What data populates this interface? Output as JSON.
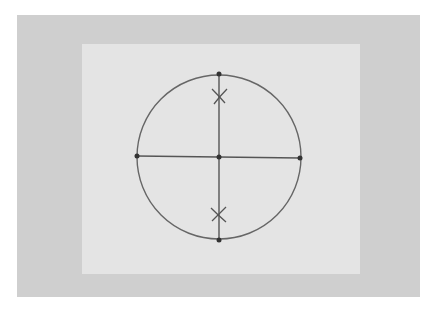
{
  "figure": {
    "colors": {
      "background": "#ffffff",
      "board": "#cfcfcf",
      "paper": "#e4e4e4",
      "ink": "#555555"
    },
    "circle": {
      "cx": 219,
      "cy": 157,
      "r": 82
    },
    "points": [
      {
        "name": "top",
        "x": 219,
        "y": 74
      },
      {
        "name": "left",
        "x": 137,
        "y": 156
      },
      {
        "name": "center",
        "x": 219,
        "y": 157
      },
      {
        "name": "right",
        "x": 300,
        "y": 158
      },
      {
        "name": "bottom",
        "x": 219,
        "y": 240
      }
    ],
    "marks": [
      {
        "name": "upper-x",
        "x": 219,
        "y": 95
      },
      {
        "name": "lower-x",
        "x": 219,
        "y": 217
      }
    ]
  }
}
